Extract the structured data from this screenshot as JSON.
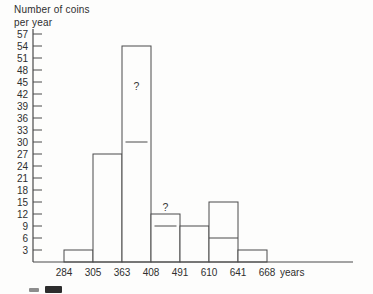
{
  "chart": {
    "title_line1": "Number of coins",
    "title_line2": "per year",
    "colors": {
      "line": "#4a4a4a",
      "text": "#2f2f2f",
      "background": "#fdfdfc",
      "bar_fill": "#fdfdfc"
    }
  },
  "chart_data": {
    "type": "bar",
    "subtype": "histogram",
    "title": "Number of coins per year",
    "ylabel": "Number of coins per year",
    "xlabel": "years",
    "x_unit": "years",
    "grid": false,
    "legend": "none",
    "ylim": [
      0,
      58
    ],
    "y_ticks": [
      3,
      6,
      9,
      12,
      15,
      18,
      21,
      24,
      27,
      30,
      33,
      36,
      39,
      42,
      45,
      48,
      51,
      54,
      57
    ],
    "class_boundaries": [
      284,
      305,
      363,
      408,
      491,
      610,
      641,
      668
    ],
    "values": [
      3,
      27,
      54,
      12,
      9,
      15,
      3
    ],
    "bars": [
      {
        "from": 284,
        "to": 305,
        "height": 3
      },
      {
        "from": 305,
        "to": 363,
        "height": 27
      },
      {
        "from": 363,
        "to": 408,
        "height": 54
      },
      {
        "from": 408,
        "to": 491,
        "height": 12
      },
      {
        "from": 491,
        "to": 610,
        "height": 9
      },
      {
        "from": 610,
        "to": 641,
        "height": 15
      },
      {
        "from": 641,
        "to": 668,
        "height": 3
      }
    ],
    "annotations": [
      {
        "text": "?",
        "bar_index": 2,
        "y": 43,
        "position": "inside"
      },
      {
        "text": "?",
        "bar_index": 3,
        "y": 14,
        "position": "above"
      }
    ],
    "markers": [
      {
        "bar_index": 2,
        "y": 30,
        "style": "short-dash"
      },
      {
        "bar_index": 3,
        "y": 9,
        "style": "short-dash"
      },
      {
        "bar_index": 5,
        "y": 6,
        "style": "full-width-line"
      }
    ]
  }
}
